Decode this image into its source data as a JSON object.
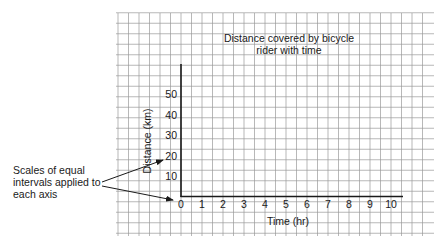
{
  "chart_data": {
    "type": "line",
    "title": "Distance covered by bicycle rider with time",
    "title_lines": [
      "Distance covered by bicycle",
      "rider with time"
    ],
    "xlabel": "Time (hr)",
    "ylabel": "Distance (km)",
    "x_ticks": [
      0,
      1,
      2,
      3,
      4,
      5,
      6,
      7,
      8,
      9,
      10
    ],
    "y_ticks": [
      10,
      20,
      30,
      40,
      50
    ],
    "xlim": [
      0,
      10
    ],
    "ylim": [
      0,
      60
    ],
    "grid": true,
    "series": [],
    "annotations": [
      {
        "text_lines": [
          "Scales of equal",
          "intervals applied to",
          "each axis"
        ],
        "arrows_to": [
          "y-axis tick 20",
          "x-axis tick 0"
        ]
      }
    ]
  },
  "colors": {
    "grid": "#9a9a9a",
    "axis": "#1a1a1a",
    "text": "#1a1a1a",
    "background": "#ffffff"
  }
}
